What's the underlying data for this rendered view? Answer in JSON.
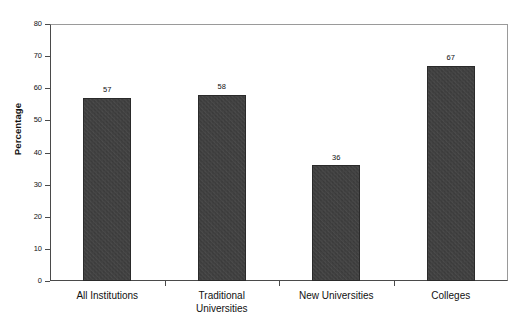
{
  "chart_data": {
    "type": "bar",
    "title": "",
    "xlabel": "",
    "ylabel": "Percentage",
    "categories": [
      "All Institutions",
      "Traditional Universities",
      "New Universities",
      "Colleges"
    ],
    "values": [
      57,
      58,
      36,
      67
    ],
    "value_labels": [
      "57",
      "58",
      "36",
      "67"
    ],
    "ylim": [
      0,
      80
    ],
    "ytick_labels": [
      "0",
      "10",
      "20",
      "30",
      "40",
      "50",
      "60",
      "70",
      "80"
    ],
    "ytick_values": [
      0,
      10,
      20,
      30,
      40,
      50,
      60,
      70,
      80
    ],
    "grid": "horizontal",
    "legend": "none",
    "bar_color": "#3b3b3b",
    "grid_color": "#b4b4b4",
    "axis_color": "#4a4a4a",
    "background": "#ffffff"
  },
  "axis": {
    "y_title": "Percentage"
  },
  "categories_display": [
    {
      "line1": "All Institutions",
      "line2": ""
    },
    {
      "line1": "Traditional",
      "line2": "Universities"
    },
    {
      "line1": "New Universities",
      "line2": ""
    },
    {
      "line1": "Colleges",
      "line2": ""
    }
  ]
}
